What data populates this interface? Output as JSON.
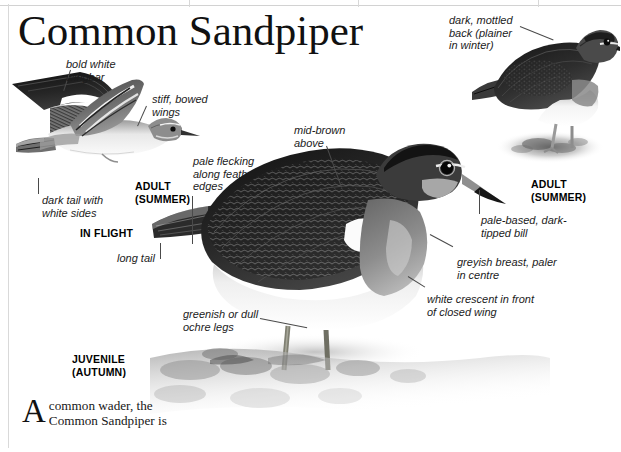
{
  "page": {
    "title": "Common Sandpiper",
    "background_color": "#ffffff",
    "ink_color": "#1b1b1b"
  },
  "figures": {
    "in_flight": {
      "caption": "IN FLIGHT",
      "subject": "common-sandpiper-in-flight"
    },
    "adult_summer_flight": {
      "caption": "ADULT\n(SUMMER)"
    },
    "juvenile": {
      "caption": "JUVENILE\n(AUTUMN)",
      "subject": "common-sandpiper-juvenile-standing"
    },
    "adult_summer_standing": {
      "caption": "ADULT\n(SUMMER)",
      "subject": "common-sandpiper-adult-standing"
    }
  },
  "annotations": [
    {
      "id": "bold-white-wingbar",
      "text": "bold white\nwingbar"
    },
    {
      "id": "stiff-bowed-wings",
      "text": "stiff, bowed\nwings"
    },
    {
      "id": "dark-tail-white-sides",
      "text": "dark tail with\nwhite sides"
    },
    {
      "id": "pale-flecking",
      "text": "pale flecking\nalong feather\nedges"
    },
    {
      "id": "long-tail",
      "text": "long tail"
    },
    {
      "id": "mid-brown-above",
      "text": "mid-brown\nabove"
    },
    {
      "id": "dark-mottled-back",
      "text": "dark, mottled\nback (plainer\nin winter)"
    },
    {
      "id": "pale-based-bill",
      "text": "pale-based, dark-\ntipped bill"
    },
    {
      "id": "greyish-breast",
      "text": "greyish breast, paler\nin centre"
    },
    {
      "id": "white-crescent",
      "text": "white crescent in front\nof closed wing"
    },
    {
      "id": "greenish-ochre-legs",
      "text": "greenish or dull\nochre legs"
    }
  ],
  "body_text": {
    "dropcap": "A",
    "lines": "common wader, the\nCommon Sandpiper is"
  }
}
